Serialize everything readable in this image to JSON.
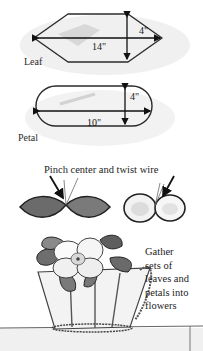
{
  "diagram": {
    "leaf": {
      "label": "Leaf",
      "length": "14\"",
      "width": "4\""
    },
    "petal": {
      "label": "Petal",
      "length": "10\"",
      "width": "4\""
    },
    "step_pinch": {
      "caption": "Pinch center and twist wire"
    },
    "step_gather": {
      "lines": [
        "Gather",
        "sets of",
        "leaves and",
        "petals into",
        "flowers"
      ]
    },
    "colors": {
      "outline": "#2b2b2b",
      "sketch_shading": "#cfcfcf",
      "leaf_fill": "#6b6b6b",
      "background": "#ffffff"
    }
  }
}
